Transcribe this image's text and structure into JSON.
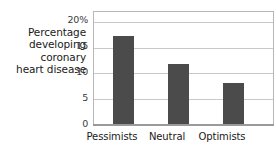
{
  "chart_data": {
    "type": "bar",
    "title": "",
    "xlabel": "",
    "ylabel": "Percentage developing coronary heart disease",
    "ylabel_lines": [
      "Percentage",
      "developing",
      "coronary",
      "heart disease"
    ],
    "categories": [
      "Pessimists",
      "Neutral",
      "Optimists"
    ],
    "values": [
      17.2,
      11.8,
      8.0
    ],
    "ylim": [
      0,
      22
    ],
    "yticks": [
      0,
      5,
      10,
      15,
      20
    ],
    "ytick_labels": [
      "0",
      "5",
      "10",
      "15",
      "20%"
    ],
    "grid": true,
    "legend": "none",
    "bar_color": "#4b4b4b",
    "gridline_color": "#c9c9c9",
    "frame_color": "#b7b7b7"
  }
}
